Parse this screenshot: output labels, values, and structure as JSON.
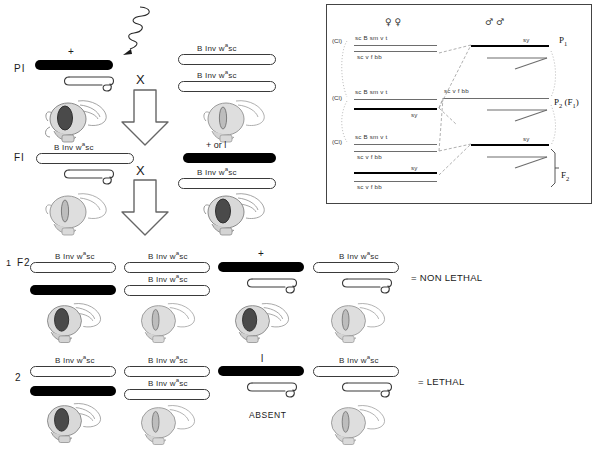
{
  "figure": {
    "title_hidden": "",
    "genotype_label": "B Inv wᵃsc",
    "genotype_label_plain": "B Inv w",
    "genotype_sup": "a",
    "genotype_tail": "sc"
  },
  "main_cross": {
    "p_label": "PI",
    "f_label": "FI",
    "cross_symbol": "X",
    "p1_left_allele": "+",
    "f1_right_allele": "+ or l",
    "mutagen_marker": "squiggle-arrow"
  },
  "f2": {
    "row1_number": "1",
    "row1_stage": "F2",
    "row2_number": "2",
    "row1_plus": "+",
    "row2_lethal_allele": "l",
    "absent_label": "ABSENT",
    "row1_result": "= NON LETHAL",
    "row2_result": "= LETHAL"
  },
  "inset": {
    "female_symbol": "♀ ♀",
    "male_symbol": "♂ ♂",
    "cl_label": "(Cl)",
    "female_top_genes": "sc  B sm     v t",
    "female_bottom_genes": "sc     v       f     bb",
    "sy_label": "sy",
    "male_genes": "sc     v       f      bb",
    "generations": [
      {
        "label": "P",
        "sub": "1",
        "suffix": ""
      },
      {
        "label": "P",
        "sub": "2",
        "suffix": " (F₁)"
      },
      {
        "label": "F",
        "sub": "2",
        "suffix": ""
      }
    ],
    "gen_p1": "P",
    "gen_p1_sub": "1",
    "gen_p2": "P",
    "gen_p2_sub": "2",
    "gen_p2_paren": "(F",
    "gen_p2_paren_sub": "1",
    "gen_p2_paren_end": ")",
    "gen_f2": "F",
    "gen_f2_sub": "2"
  },
  "colors": {
    "ink": "#1a1a1a",
    "chromosome_outline": "#3a3a3a",
    "chromosome_black": "#000000",
    "box_border": "#444444",
    "dotted": "#9a9a9a"
  }
}
